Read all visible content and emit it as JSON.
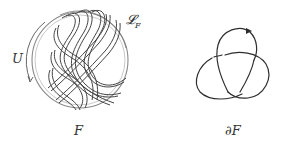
{
  "figure": {
    "left_panel": {
      "name": "Seifert surface F with braid strands",
      "labels": {
        "surface": "F",
        "link": "𝓛",
        "link_subscript": "F",
        "arrow": "U"
      }
    },
    "right_panel": {
      "name": "Boundary trefoil knot",
      "labels": {
        "boundary": "∂F"
      }
    },
    "colors": {
      "stroke": "#3a3a3a",
      "circle": "#888888",
      "background": "#ffffff"
    }
  }
}
